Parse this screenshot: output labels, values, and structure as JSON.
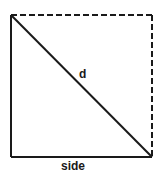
{
  "diagram": {
    "shape": "square-with-diagonal",
    "diagonal_label": "d",
    "side_label": "side",
    "solid_edges": [
      "left",
      "bottom",
      "diagonal"
    ],
    "dashed_edges": [
      "top",
      "right"
    ],
    "colors": {
      "line": "#1a1a1a",
      "background": "#ffffff"
    }
  }
}
